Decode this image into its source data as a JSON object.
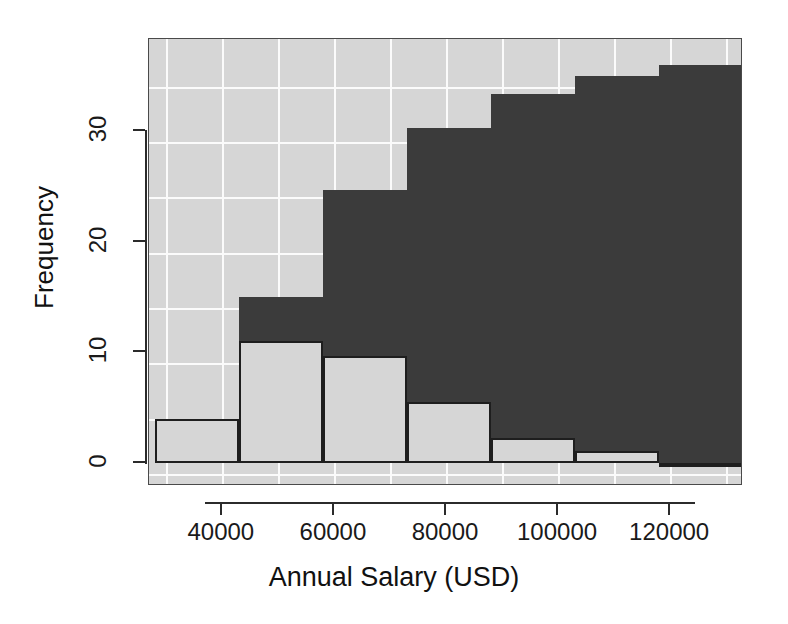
{
  "chart_data": {
    "type": "bar",
    "title": "",
    "subtitle": "",
    "xlabel": "Annual Salary (USD)",
    "ylabel": "Frequency",
    "xlim": [
      27000,
      133000
    ],
    "ylim": [
      -1,
      37.5
    ],
    "grid": true,
    "grid_color": "#fbfbfb",
    "panel_background": "#d6d6d6",
    "legend": null,
    "legend_position": "none",
    "note": "Two overlaid histograms of annual salary; light-gray outlined series and dark-gray filled series share the same bins.",
    "bin_width": 15000,
    "bin_edges": [
      28000,
      43000,
      58000,
      73000,
      88000,
      103000,
      118000,
      133000
    ],
    "categories": [
      "28000-43000",
      "43000-58000",
      "58000-73000",
      "73000-88000",
      "88000-103000",
      "103000-118000",
      "118000-133000"
    ],
    "series": [
      {
        "name": "light-series",
        "color": "#d6d6d6",
        "edge_color": "#1e1e1e",
        "values": [
          4,
          11,
          9.7,
          5.5,
          2.3,
          1.1,
          0
        ]
      },
      {
        "name": "dark-series",
        "color": "#3b3b3b",
        "edge_color": "#3b3b3b",
        "values": [
          0,
          15,
          24.7,
          30.3,
          33.3,
          35,
          36
        ]
      }
    ],
    "xticks": [
      40000,
      60000,
      80000,
      100000,
      120000
    ],
    "xtick_labels": [
      "40000",
      "60000",
      "80000",
      "100000",
      "120000"
    ],
    "yticks": [
      0,
      10,
      20,
      30
    ],
    "ytick_labels": [
      "0",
      "10",
      "20",
      "30"
    ]
  },
  "axes": {
    "y_label": "Frequency",
    "x_label": "Annual Salary (USD)"
  }
}
